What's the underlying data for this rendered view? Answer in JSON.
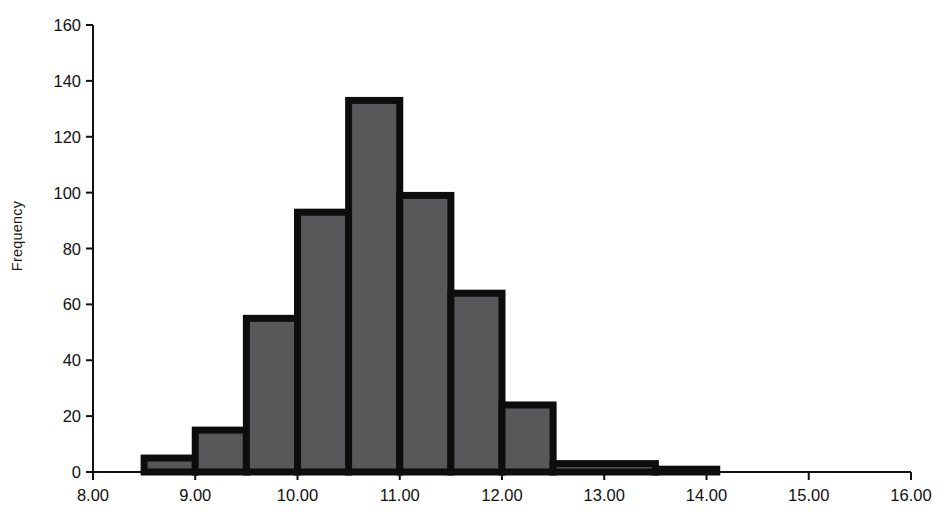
{
  "chart_data": {
    "type": "bar",
    "title": "",
    "subtitle": "",
    "xlabel": "",
    "ylabel": "Frequency",
    "grid": false,
    "legend": null,
    "xlim": [
      8.0,
      16.0
    ],
    "ylim": [
      0,
      160
    ],
    "x_tick_labels": [
      "8.00",
      "9.00",
      "10.00",
      "11.00",
      "12.00",
      "13.00",
      "14.00",
      "15.00",
      "16.00"
    ],
    "x_tick_values": [
      8,
      9,
      10,
      11,
      12,
      13,
      14,
      15,
      16
    ],
    "y_tick_labels": [
      "0",
      "20",
      "40",
      "60",
      "80",
      "100",
      "120",
      "140",
      "160"
    ],
    "y_tick_values": [
      0,
      20,
      40,
      60,
      80,
      100,
      120,
      140,
      160
    ],
    "bin_width": 0.5,
    "bin_edges": [
      8.5,
      9.0,
      9.5,
      10.0,
      10.5,
      11.0,
      11.5,
      12.0,
      12.5,
      13.0,
      13.5,
      14.5,
      15.1
    ],
    "bars": [
      {
        "x0": 8.5,
        "x1": 9.0,
        "value": 5
      },
      {
        "x0": 9.0,
        "x1": 9.5,
        "value": 15
      },
      {
        "x0": 9.5,
        "x1": 10.0,
        "value": 55
      },
      {
        "x0": 10.0,
        "x1": 10.5,
        "value": 93
      },
      {
        "x0": 10.5,
        "x1": 11.0,
        "value": 133
      },
      {
        "x0": 11.0,
        "x1": 11.5,
        "value": 99
      },
      {
        "x0": 11.5,
        "x1": 12.0,
        "value": 64
      },
      {
        "x0": 12.0,
        "x1": 12.5,
        "value": 24
      },
      {
        "x0": 12.5,
        "x1": 13.5,
        "value": 3
      },
      {
        "x0": 13.5,
        "x1": 14.1,
        "value": 1
      }
    ],
    "categories": [
      "8.5-9.0",
      "9.0-9.5",
      "9.5-10.0",
      "10.0-10.5",
      "10.5-11.0",
      "11.0-11.5",
      "11.5-12.0",
      "12.0-12.5",
      "12.5-13.5",
      "13.5-14.1"
    ],
    "values": [
      5,
      15,
      55,
      93,
      133,
      99,
      64,
      24,
      3,
      1
    ],
    "colors": {
      "bar_fill": "#58585a",
      "bar_stroke": "#0d0d0d",
      "axis": "#111111",
      "text": "#111111",
      "background": "#ffffff"
    }
  }
}
